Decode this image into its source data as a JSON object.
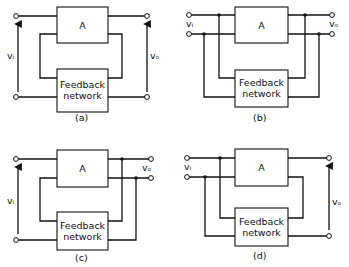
{
  "figure": {
    "panels": [
      {
        "id": "a",
        "caption": "(a)",
        "amp_label": "A",
        "fb_label_line1": "Feedback",
        "fb_label_line2": "network",
        "vin": "vᵢ",
        "vout": "vₒ",
        "topology": "series-shunt"
      },
      {
        "id": "b",
        "caption": "(b)",
        "amp_label": "A",
        "fb_label_line1": "Feedback",
        "fb_label_line2": "network",
        "vin": "vᵢ",
        "vout": "vₒ",
        "topology": "shunt-shunt"
      },
      {
        "id": "c",
        "caption": "(c)",
        "amp_label": "A",
        "fb_label_line1": "Feedback",
        "fb_label_line2": "network",
        "vin": "vᵢ",
        "vout": "vₒ",
        "topology": "series-shunt output"
      },
      {
        "id": "d",
        "caption": "(d)",
        "amp_label": "A",
        "fb_label_line1": "Feedback",
        "fb_label_line2": "network",
        "vin": "vᵢ",
        "vout": "vₒ",
        "topology": "shunt-series"
      }
    ]
  }
}
